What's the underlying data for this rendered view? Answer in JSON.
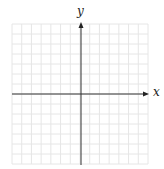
{
  "diagram": {
    "type": "coordinate-plane",
    "x_axis_label": "x",
    "y_axis_label": "y",
    "grid": {
      "columns": 14,
      "rows": 14,
      "left": 12,
      "top": 24,
      "right": 148,
      "bottom": 164,
      "line_color": "#e6e6e6"
    },
    "origin": {
      "x": 81,
      "y": 94
    },
    "axis_color": "#333333"
  }
}
